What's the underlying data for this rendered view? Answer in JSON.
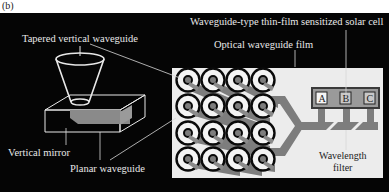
{
  "figure_label": "(b)",
  "labels": {
    "tapered_vertical_waveguide": "Tapered vertical waveguide",
    "solar_cell": "Waveguide-type thin-film sensitized solar cell",
    "optical_waveguide_film": "Optical waveguide film",
    "vertical_mirror": "Vertical mirror",
    "planar_waveguide": "Planar waveguide",
    "wavelength_filter_line1": "Wavelength",
    "wavelength_filter_line2": "filter"
  },
  "cells": [
    "A",
    "B",
    "C"
  ],
  "grid": {
    "rows": 4,
    "cols": 4
  },
  "colors": {
    "background": "#050505",
    "film": "#ececec",
    "waveguide": "#7a7a7a",
    "line": "#e8e8e8"
  }
}
